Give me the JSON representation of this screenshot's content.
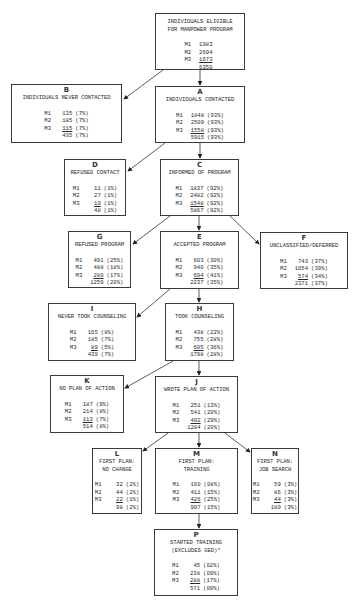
{
  "nodes": {
    "top": {
      "letter": "",
      "title": "INDIVIDUALS ELIGIBLE\nFOR MANPOWER PROGRAM",
      "rows": [
        {
          "label": "M1",
          "n": "1983",
          "pct": ""
        },
        {
          "label": "M2",
          "n": "2694",
          "pct": ""
        },
        {
          "label": "M3",
          "n": "1673",
          "pct": ""
        }
      ],
      "total": {
        "n": "6350",
        "pct": ""
      }
    },
    "A": {
      "letter": "A",
      "title": "INDIVIDUALS CONTACTED",
      "rows": [
        {
          "label": "M1",
          "n": "1848",
          "pct": "(93%)"
        },
        {
          "label": "M2",
          "n": "2509",
          "pct": "(93%)"
        },
        {
          "label": "M3",
          "n": "1558",
          "pct": "(93%)"
        }
      ],
      "total": {
        "n": "5915",
        "pct": "(93%)"
      }
    },
    "B": {
      "letter": "B",
      "title": "INDIVIDUALS NEVER CONTACTED",
      "rows": [
        {
          "label": "M1",
          "n": "135",
          "pct": "(7%)"
        },
        {
          "label": "M2",
          "n": "185",
          "pct": "(7%)"
        },
        {
          "label": "M3",
          "n": "115",
          "pct": "(7%)"
        }
      ],
      "total": {
        "n": "435",
        "pct": "(7%)"
      }
    },
    "C": {
      "letter": "C",
      "title": "INFORMED OF PROGRAM",
      "rows": [
        {
          "label": "M1",
          "n": "1837",
          "pct": "(92%)"
        },
        {
          "label": "M2",
          "n": "2482",
          "pct": "(92%)"
        },
        {
          "label": "M3",
          "n": "1548",
          "pct": "(92%)"
        }
      ],
      "total": {
        "n": "5867",
        "pct": "(92%)"
      }
    },
    "D": {
      "letter": "D",
      "title": "REFUSED CONTACT",
      "rows": [
        {
          "label": "M1",
          "n": "11",
          "pct": "(1%)"
        },
        {
          "label": "M2",
          "n": "27",
          "pct": "(1%)"
        },
        {
          "label": "M3",
          "n": "10",
          "pct": "(1%)"
        }
      ],
      "total": {
        "n": "48",
        "pct": "(1%)"
      }
    },
    "E": {
      "letter": "E",
      "title": "ACCEPTED PROGRAM",
      "rows": [
        {
          "label": "M1",
          "n": "603",
          "pct": "(30%)"
        },
        {
          "label": "M2",
          "n": "940",
          "pct": "(35%)"
        },
        {
          "label": "M3",
          "n": "694",
          "pct": "(41%)"
        }
      ],
      "total": {
        "n": "2237",
        "pct": "(35%)"
      }
    },
    "F": {
      "letter": "F",
      "title": "UNCLASSIFIED/DEFERRED",
      "rows": [
        {
          "label": "M1",
          "n": "743",
          "pct": "(37%)"
        },
        {
          "label": "M2",
          "n": "1054",
          "pct": "(39%)"
        },
        {
          "label": "M3",
          "n": "574",
          "pct": "(34%)"
        }
      ],
      "total": {
        "n": "2371",
        "pct": "(37%)"
      }
    },
    "G": {
      "letter": "G",
      "title": "REFUSED PROGRAM",
      "rows": [
        {
          "label": "M1",
          "n": "491",
          "pct": "(25%)"
        },
        {
          "label": "M2",
          "n": "488",
          "pct": "(18%)"
        },
        {
          "label": "M3",
          "n": "280",
          "pct": "(17%)"
        }
      ],
      "total": {
        "n": "1259",
        "pct": "(20%)"
      }
    },
    "H": {
      "letter": "H",
      "title": "TOOK COUNSELING",
      "rows": [
        {
          "label": "M1",
          "n": "438",
          "pct": "(22%)"
        },
        {
          "label": "M2",
          "n": "755",
          "pct": "(28%)"
        },
        {
          "label": "M3",
          "n": "605",
          "pct": "(36%)"
        }
      ],
      "total": {
        "n": "1798",
        "pct": "(28%)"
      }
    },
    "I": {
      "letter": "I",
      "title": "NEVER TOOK COUNSELING",
      "rows": [
        {
          "label": "M1",
          "n": "165",
          "pct": "(8%)"
        },
        {
          "label": "M2",
          "n": "185",
          "pct": "(7%)"
        },
        {
          "label": "M3",
          "n": "89",
          "pct": "(5%)"
        }
      ],
      "total": {
        "n": "439",
        "pct": "(7%)"
      }
    },
    "J": {
      "letter": "J",
      "title": "WROTE PLAN OF ACTION",
      "rows": [
        {
          "label": "M1",
          "n": "251",
          "pct": "(13%)"
        },
        {
          "label": "M2",
          "n": "541",
          "pct": "(20%)"
        },
        {
          "label": "M3",
          "n": "492",
          "pct": "(29%)"
        }
      ],
      "total": {
        "n": "1284",
        "pct": "(20%)"
      }
    },
    "K": {
      "letter": "K",
      "title": "NO PLAN OF ACTION",
      "rows": [
        {
          "label": "M1",
          "n": "187",
          "pct": "(9%)"
        },
        {
          "label": "M2",
          "n": "214",
          "pct": "(8%)"
        },
        {
          "label": "M3",
          "n": "113",
          "pct": "(7%)"
        }
      ],
      "total": {
        "n": "514",
        "pct": "(8%)"
      }
    },
    "L": {
      "letter": "L",
      "title": "FIRST PLAN:\nNO CHANGE",
      "rows": [
        {
          "label": "M1",
          "n": "32",
          "pct": "(2%)"
        },
        {
          "label": "M2",
          "n": "44",
          "pct": "(2%)"
        },
        {
          "label": "M3",
          "n": "22",
          "pct": "(1%)"
        }
      ],
      "total": {
        "n": "98",
        "pct": "(2%)"
      }
    },
    "M": {
      "letter": "M",
      "title": "FIRST PLAN:\nTRAINING",
      "rows": [
        {
          "label": "M1",
          "n": "160",
          "pct": "(08%)"
        },
        {
          "label": "M2",
          "n": "411",
          "pct": "(15%)"
        },
        {
          "label": "M3",
          "n": "426",
          "pct": "(25%)"
        }
      ],
      "total": {
        "n": "997",
        "pct": "(15%)"
      }
    },
    "N": {
      "letter": "N",
      "title": "FIRST PLAN:\nJOB SEARCH",
      "rows": [
        {
          "label": "M1",
          "n": "59",
          "pct": "(3%)"
        },
        {
          "label": "M2",
          "n": "86",
          "pct": "(3%)"
        },
        {
          "label": "M3",
          "n": "44",
          "pct": "(3%)"
        }
      ],
      "total": {
        "n": "189",
        "pct": "(3%)"
      }
    },
    "P": {
      "letter": "P",
      "title": "STARTED TRAINING\n(EXCLUDES GED)*",
      "rows": [
        {
          "label": "M1",
          "n": "45",
          "pct": "(02%)"
        },
        {
          "label": "M2",
          "n": "238",
          "pct": "(09%)"
        },
        {
          "label": "M3",
          "n": "288",
          "pct": "(17%)"
        }
      ],
      "total": {
        "n": "571",
        "pct": "(09%)"
      }
    }
  },
  "edges": [
    [
      "top",
      "A"
    ],
    [
      "top",
      "B"
    ],
    [
      "A",
      "C"
    ],
    [
      "A",
      "D"
    ],
    [
      "C",
      "E"
    ],
    [
      "C",
      "G"
    ],
    [
      "C",
      "F"
    ],
    [
      "E",
      "H"
    ],
    [
      "E",
      "I"
    ],
    [
      "H",
      "J"
    ],
    [
      "H",
      "K"
    ],
    [
      "J",
      "M"
    ],
    [
      "J",
      "L"
    ],
    [
      "J",
      "N"
    ],
    [
      "M",
      "P"
    ]
  ],
  "colors": {
    "line": "#3a3a3a",
    "text": "#2a2a2a",
    "background": "#ffffff"
  }
}
